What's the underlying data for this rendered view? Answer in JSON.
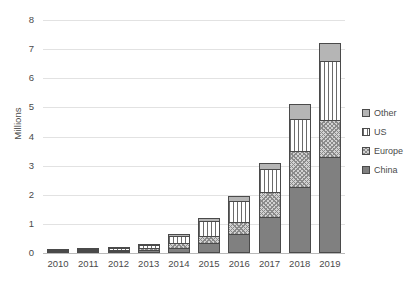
{
  "chart_data": {
    "type": "bar",
    "stacked": true,
    "title": "",
    "xlabel": "",
    "ylabel": "Millions",
    "ylim": [
      0,
      8
    ],
    "yticks": [
      0,
      1,
      2,
      3,
      4,
      5,
      6,
      7,
      8
    ],
    "grid": true,
    "legend_position": "right",
    "categories": [
      "2010",
      "2011",
      "2012",
      "2013",
      "2014",
      "2015",
      "2016",
      "2017",
      "2018",
      "2019"
    ],
    "series": [
      {
        "name": "China",
        "values": [
          0.01,
          0.02,
          0.06,
          0.1,
          0.18,
          0.35,
          0.65,
          1.25,
          2.25,
          3.3
        ]
      },
      {
        "name": "Europe",
        "values": [
          0.01,
          0.02,
          0.04,
          0.07,
          0.16,
          0.25,
          0.4,
          0.85,
          1.25,
          1.25
        ]
      },
      {
        "name": "US",
        "values": [
          0.01,
          0.02,
          0.05,
          0.1,
          0.25,
          0.5,
          0.75,
          0.8,
          1.1,
          2.05
        ]
      },
      {
        "name": "Other",
        "values": [
          0.0,
          0.01,
          0.02,
          0.03,
          0.06,
          0.1,
          0.15,
          0.2,
          0.5,
          0.6
        ]
      }
    ],
    "totals": [
      0.03,
      0.07,
      0.17,
      0.3,
      0.65,
      1.2,
      1.95,
      3.1,
      5.1,
      7.2
    ]
  },
  "legend": {
    "items": [
      {
        "label": "Other",
        "pattern": "solid-light-gray",
        "color": "#b5b5b5"
      },
      {
        "label": "US",
        "pattern": "vertical-lines",
        "color": "#ffffff"
      },
      {
        "label": "Europe",
        "pattern": "crosshatch",
        "color": "#d2d2d2"
      },
      {
        "label": "China",
        "pattern": "solid-gray",
        "color": "#808080"
      }
    ]
  },
  "axis": {
    "y_title": "Millions",
    "y_tick_labels": [
      "0",
      "1",
      "2",
      "3",
      "4",
      "5",
      "6",
      "7",
      "8"
    ],
    "x_tick_labels": [
      "2010",
      "2011",
      "2012",
      "2013",
      "2014",
      "2015",
      "2016",
      "2017",
      "2018",
      "2019"
    ]
  },
  "colors": {
    "china": "#808080",
    "europe": "#d2d2d2",
    "us": "#ffffff",
    "other": "#b5b5b5",
    "grid": "#e2e2e2",
    "text": "#4a4a4a",
    "outline": "#4a4a4a"
  }
}
